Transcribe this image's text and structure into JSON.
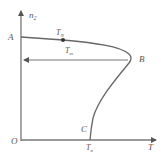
{
  "diagram": {
    "type": "phase-curve",
    "axes": {
      "y_label": "n",
      "y_label_sub": "2",
      "x_label": "T",
      "origin_label": "O"
    },
    "points": {
      "A": "A",
      "B": "B",
      "C": "C"
    },
    "annotations": {
      "TN_main": "T",
      "TN_sub": "N",
      "Tm_main": "T",
      "Tm_sub": "m",
      "Tn_main": "T",
      "Tn_sub": "n"
    },
    "colors": {
      "line": "#666666",
      "axis": "#777777",
      "text": "#555555"
    }
  }
}
